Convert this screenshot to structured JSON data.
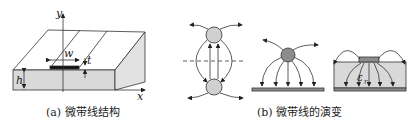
{
  "panel_a": {
    "caption": "(a) 微带线结构",
    "labels": {
      "y_axis": "y",
      "x_axis": "x",
      "width": "w",
      "thickness": "t",
      "height": "h"
    }
  },
  "panel_b": {
    "caption": "(b) 微带线的演变",
    "labels": {
      "permittivity": "εr"
    }
  },
  "colors": {
    "substrate": "#d9d9d9",
    "conductor": "#8c8c8c",
    "strip": "#111111",
    "line": "#333333"
  }
}
